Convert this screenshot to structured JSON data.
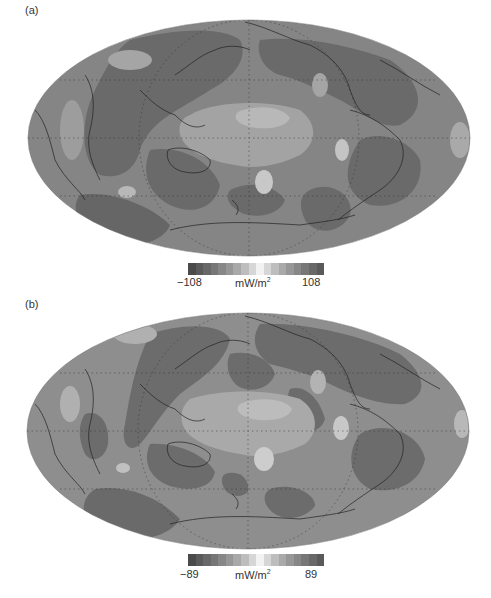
{
  "panels": [
    {
      "label": "(a)",
      "colorbar": {
        "min_label": "−108",
        "max_label": "108",
        "unit": "mW/m",
        "unit_exp": "2",
        "min": -108,
        "max": 108
      }
    },
    {
      "label": "(b)",
      "colorbar": {
        "min_label": "−89",
        "max_label": "89",
        "unit": "mW/m",
        "unit_exp": "2",
        "min": -89,
        "max": 89
      }
    }
  ],
  "projection": "Mollweide (Pacific-centred)",
  "colorbar_steps": [
    "#4a4a4a",
    "#5a5a5a",
    "#686868",
    "#777777",
    "#878787",
    "#979797",
    "#a9a9a9",
    "#bdbdbd",
    "#d6d6d6",
    "#f2f2f2",
    "#d6d6d6",
    "#bdbdbd",
    "#a9a9a9",
    "#979797",
    "#878787",
    "#777777",
    "#686868",
    "#5a5a5a"
  ],
  "map_colors": {
    "darkest": "#5f5f5f",
    "dark": "#6e6e6e",
    "mid": "#858585",
    "light": "#9c9c9c",
    "lighter": "#b3b3b3",
    "lightest": "#c9c9c9"
  }
}
